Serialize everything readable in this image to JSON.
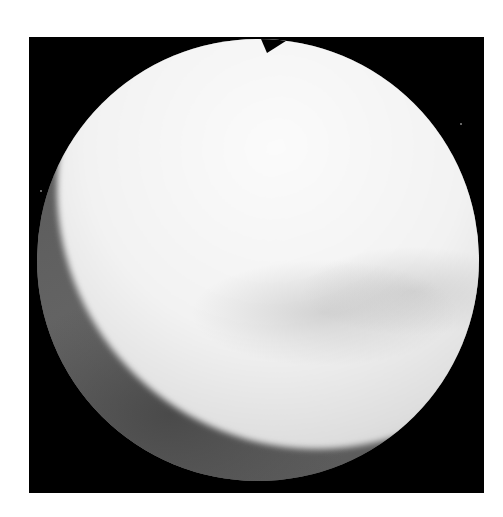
{
  "image": {
    "kind": "endoscopic view",
    "palette": {
      "background": "#ffffff",
      "frame": "#000000",
      "bright_tissue": "#f5f5f5",
      "dark_tissue": "#5a5a5a"
    },
    "frame_box": {
      "x": 29,
      "y": 37,
      "width": 455,
      "height": 456
    },
    "viewport": {
      "shape": "circle",
      "diameter": 442
    },
    "notch": {
      "position": "top",
      "x": 270
    }
  }
}
